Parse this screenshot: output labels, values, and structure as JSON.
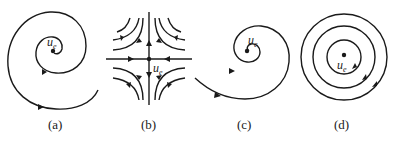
{
  "figure": {
    "panels": [
      {
        "id": "a",
        "caption": "(a)",
        "type": "stable-focus",
        "point_label": "u",
        "point_sub": "e",
        "description": "spiral trajectory converging inward to equilibrium"
      },
      {
        "id": "b",
        "caption": "(b)",
        "type": "saddle",
        "point_label": "u",
        "point_sub": "e",
        "description": "saddle point with hyperbolic trajectories"
      },
      {
        "id": "c",
        "caption": "(c)",
        "type": "unstable-focus",
        "point_label": "u",
        "point_sub": "e",
        "description": "spiral trajectory diverging outward from equilibrium"
      },
      {
        "id": "d",
        "caption": "(d)",
        "type": "center",
        "point_label": "u",
        "point_sub": "e",
        "description": "concentric closed orbits around equilibrium"
      }
    ]
  },
  "style": {
    "stroke_color": "#1a1a1a",
    "background": "#ffffff"
  }
}
